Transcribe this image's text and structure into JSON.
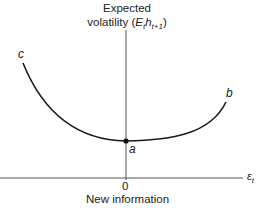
{
  "figure": {
    "y_axis_label_line1": "Expected",
    "y_axis_label_line2_prefix": "volatility (",
    "y_axis_label_symbol": "E",
    "y_axis_label_sub1": "t",
    "y_axis_label_h": "h",
    "y_axis_label_sub2": "t+1",
    "y_axis_label_suffix": ")",
    "x_axis_label": "New information",
    "x_axis_symbol": "ε",
    "x_axis_symbol_sub": "t",
    "origin_tick": "0",
    "points": {
      "a": "a",
      "b": "b",
      "c": "c"
    },
    "colors": {
      "curve": "#1a1a1a",
      "axes": "#555555",
      "background": "#ffffff"
    }
  }
}
